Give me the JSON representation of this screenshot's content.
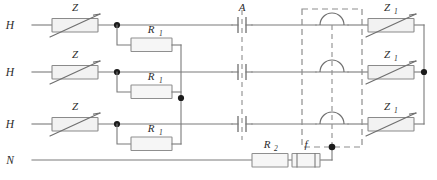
{
  "diagram": {
    "background_color": "#ffffff",
    "wire_color": "#7a7a7a",
    "component_fill": "#f2f2f2",
    "component_stroke": "#8a8a8a",
    "node_color": "#1b1b1b",
    "dashed_color": "#8d8d8d",
    "label_color": "#2b2b2b"
  },
  "terminals": {
    "line1": "H",
    "line2": "H",
    "line3": "H",
    "neutral": "N"
  },
  "components": {
    "varistor_in_1": {
      "label": "Z",
      "subscript": "",
      "type": "varistor"
    },
    "varistor_in_2": {
      "label": "Z",
      "subscript": "",
      "type": "varistor"
    },
    "varistor_in_3": {
      "label": "Z",
      "subscript": "",
      "type": "varistor"
    },
    "resistor_r1_1": {
      "label": "R",
      "subscript": "1",
      "type": "resistor"
    },
    "resistor_r1_2": {
      "label": "R",
      "subscript": "1",
      "type": "resistor"
    },
    "resistor_r1_3": {
      "label": "R",
      "subscript": "1",
      "type": "resistor"
    },
    "contact_a": {
      "label": "A",
      "type": "ganged-contact",
      "poles": 3
    },
    "spark_gap_assembly": {
      "label": "",
      "type": "spark-gap-array",
      "gaps": 3
    },
    "varistor_out_1": {
      "label": "Z",
      "subscript": "1",
      "type": "varistor"
    },
    "varistor_out_2": {
      "label": "Z",
      "subscript": "1",
      "type": "varistor"
    },
    "varistor_out_3": {
      "label": "Z",
      "subscript": "1",
      "type": "varistor"
    },
    "resistor_r2": {
      "label": "R",
      "subscript": "2",
      "type": "resistor"
    },
    "fuse_f": {
      "label": "f",
      "subscript": "",
      "type": "fuse"
    }
  },
  "nodes": {
    "junction_line1": "junction",
    "junction_line2": "junction",
    "junction_line3": "junction",
    "junction_r1_bus": "junction",
    "junction_output_bus": "junction",
    "junction_gap_bottom": "junction"
  }
}
